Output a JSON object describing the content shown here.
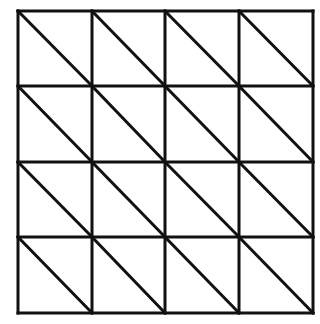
{
  "diagram": {
    "title": "",
    "type": "triangulated-square-grid",
    "rows": 4,
    "cols": 4,
    "x_lines": [
      18,
      92,
      165,
      239,
      313
    ],
    "y_lines": [
      11,
      86,
      162,
      237,
      313
    ],
    "diagonal_direction": "top-left-to-bottom-right",
    "stroke_color": "#111111",
    "stroke_width": 3,
    "background": "#ffffff"
  }
}
